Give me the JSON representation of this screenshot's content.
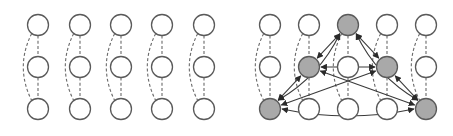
{
  "figure": {
    "width": 453,
    "height": 136,
    "colors": {
      "background": "#ffffff",
      "node_fill_default": "#ffffff",
      "node_fill_selected": "#a9a9a9",
      "node_stroke": "#5a5a5a",
      "dashed_edge": "#6a6a6a",
      "arrow_edge": "#3a3a3a"
    },
    "node_radius": 10.5,
    "panels": [
      {
        "id": "left",
        "description": "Five independent chains of three nodes, each linked by dashed edges (adjacent + skip connection)",
        "columns_x": [
          38,
          80,
          121,
          162,
          204
        ],
        "rows_y": [
          25,
          67,
          109
        ],
        "selected_nodes": [],
        "arrows": []
      },
      {
        "id": "right",
        "description": "Same five chains with five highlighted nodes fully connected by bidirectional arrows",
        "columns_x": [
          270,
          309,
          348,
          387,
          426
        ],
        "rows_y": [
          25,
          67,
          109
        ],
        "selected_nodes": [
          [
            2,
            0
          ],
          [
            1,
            1
          ],
          [
            3,
            1
          ],
          [
            0,
            2
          ],
          [
            4,
            2
          ]
        ],
        "arrows": [
          {
            "from": [
              2,
              0
            ],
            "to": [
              1,
              1
            ],
            "curve": 0
          },
          {
            "from": [
              2,
              0
            ],
            "to": [
              3,
              1
            ],
            "curve": 0
          },
          {
            "from": [
              2,
              0
            ],
            "to": [
              0,
              2
            ],
            "curve": -14
          },
          {
            "from": [
              2,
              0
            ],
            "to": [
              4,
              2
            ],
            "curve": 14
          },
          {
            "from": [
              1,
              1
            ],
            "to": [
              3,
              1
            ],
            "curve": 0
          },
          {
            "from": [
              1,
              1
            ],
            "to": [
              0,
              2
            ],
            "curve": 0
          },
          {
            "from": [
              1,
              1
            ],
            "to": [
              4,
              2
            ],
            "curve": 0
          },
          {
            "from": [
              3,
              1
            ],
            "to": [
              0,
              2
            ],
            "curve": 0
          },
          {
            "from": [
              3,
              1
            ],
            "to": [
              4,
              2
            ],
            "curve": 0
          },
          {
            "from": [
              0,
              2
            ],
            "to": [
              4,
              2
            ],
            "curve": 14
          }
        ]
      }
    ]
  }
}
